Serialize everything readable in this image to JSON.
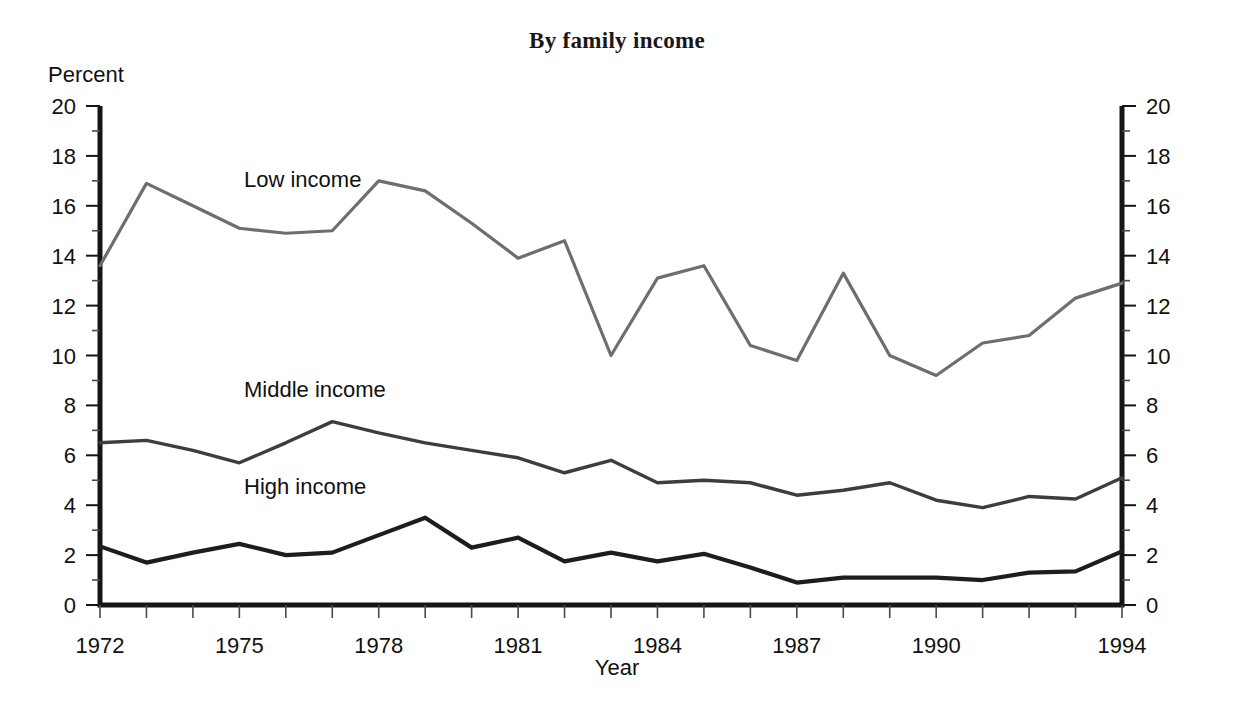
{
  "chart_data": {
    "type": "line",
    "title": "By family income",
    "xlabel": "Year",
    "ylabel": "Percent",
    "ylim": [
      0,
      20
    ],
    "xlim": [
      1972,
      1994
    ],
    "grid": false,
    "legend": "inline-labels",
    "y_ticks_major": [
      0,
      2,
      4,
      6,
      8,
      10,
      12,
      14,
      16,
      18,
      20
    ],
    "y_ticks_minor": [
      1,
      3,
      5,
      7,
      9,
      11,
      13,
      15,
      17,
      19
    ],
    "y_tick_labels": [
      "0",
      "2",
      "4",
      "6",
      "8",
      "10",
      "12",
      "14",
      "16",
      "18",
      "20"
    ],
    "x_tick_labels": [
      "1972",
      "1975",
      "1978",
      "1981",
      "1984",
      "1987",
      "1990",
      "1994"
    ],
    "x": [
      1972,
      1973,
      1974,
      1975,
      1976,
      1977,
      1978,
      1979,
      1980,
      1981,
      1982,
      1983,
      1984,
      1985,
      1986,
      1987,
      1988,
      1989,
      1990,
      1991,
      1992,
      1993,
      1994
    ],
    "series": [
      {
        "name": "Low income",
        "color": "#6e6e6e",
        "width": 3.2,
        "label_x": 1975.1,
        "label_y": 16.75,
        "values": [
          13.6,
          16.9,
          16.0,
          15.1,
          14.9,
          15.0,
          17.0,
          16.6,
          15.3,
          13.9,
          14.6,
          10.0,
          13.1,
          13.6,
          10.4,
          9.8,
          13.3,
          10.0,
          9.2,
          10.5,
          10.8,
          12.3,
          12.9
        ]
      },
      {
        "name": "Middle income",
        "color": "#3d3d3d",
        "width": 3.4,
        "label_x": 1975.1,
        "label_y": 8.35,
        "values": [
          6.5,
          6.6,
          6.2,
          5.7,
          6.5,
          7.35,
          6.9,
          6.5,
          6.2,
          5.9,
          5.3,
          5.8,
          4.9,
          5.0,
          4.9,
          4.4,
          4.6,
          4.9,
          4.2,
          3.9,
          4.35,
          4.25,
          5.1
        ]
      },
      {
        "name": "High income",
        "color": "#1d1d1d",
        "width": 4.2,
        "label_x": 1975.1,
        "label_y": 4.45,
        "values": [
          2.35,
          1.7,
          2.1,
          2.45,
          2.0,
          2.1,
          2.8,
          3.5,
          2.3,
          2.7,
          1.75,
          2.1,
          1.75,
          2.05,
          1.5,
          0.9,
          1.1,
          1.1,
          1.1,
          1.0,
          1.3,
          1.35,
          2.15
        ]
      }
    ]
  }
}
